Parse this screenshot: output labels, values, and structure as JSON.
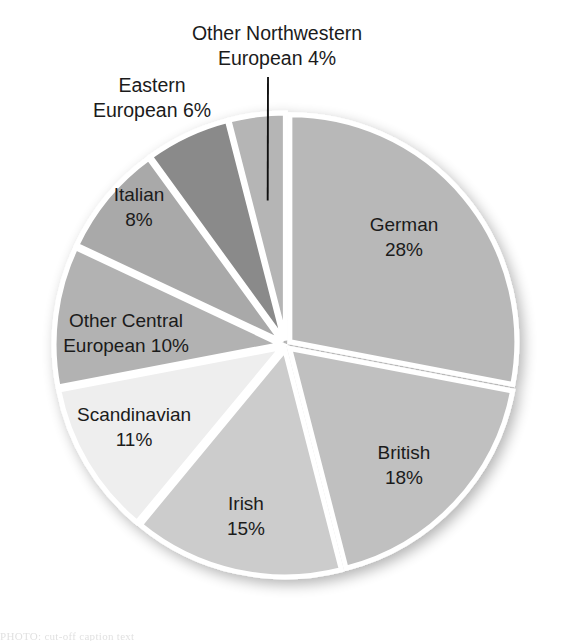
{
  "chart_data": {
    "type": "pie",
    "title": "",
    "subtitle": "",
    "xlabel": "",
    "ylabel": "",
    "legend_position": "none",
    "grid": false,
    "units": "percent",
    "start_angle_deg": 0,
    "direction": "clockwise",
    "categories": [
      "German",
      "British",
      "Irish",
      "Scandinavian",
      "Other Central European",
      "Italian",
      "Eastern European",
      "Other Northwestern European"
    ],
    "values": [
      28,
      18,
      15,
      11,
      10,
      8,
      6,
      4
    ],
    "slices": [
      {
        "name": "German",
        "value": 28,
        "label_line1": "German",
        "label_line2": "28%",
        "percent_text": "28%",
        "color": "#b8b8b8",
        "label_placement": "inside"
      },
      {
        "name": "British",
        "value": 18,
        "label_line1": "British",
        "label_line2": "18%",
        "percent_text": "18%",
        "color": "#c0c0c0",
        "label_placement": "inside"
      },
      {
        "name": "Irish",
        "value": 15,
        "label_line1": "Irish",
        "label_line2": "15%",
        "percent_text": "15%",
        "color": "#cccccc",
        "label_placement": "inside"
      },
      {
        "name": "Scandinavian",
        "value": 11,
        "label_line1": "Scandinavian",
        "label_line2": "11%",
        "percent_text": "11%",
        "color": "#eeeeee",
        "label_placement": "inside"
      },
      {
        "name": "Other Central European",
        "value": 10,
        "label_line1": "Other Central",
        "label_line2": "European 10%",
        "percent_text": "10%",
        "color": "#b2b2b2",
        "label_placement": "inside"
      },
      {
        "name": "Italian",
        "value": 8,
        "label_line1": "Italian",
        "label_line2": "8%",
        "percent_text": "8%",
        "color": "#a9a9a9",
        "label_placement": "inside"
      },
      {
        "name": "Eastern European",
        "value": 6,
        "label_line1": "Eastern",
        "label_line2": "European 6%",
        "percent_text": "6%",
        "color": "#8a8a8a",
        "label_placement": "outside"
      },
      {
        "name": "Other Northwestern European",
        "value": 4,
        "label_line1": "Other Northwestern",
        "label_line2": "European 4%",
        "percent_text": "4%",
        "color": "#b5b5b5",
        "label_placement": "outside-leader"
      }
    ],
    "colors": {
      "background": "#ffffff",
      "slice_border": "#ffffff",
      "label_text": "#1b1b1b",
      "leader_line": "#111111"
    }
  },
  "figure": {
    "bottom_caption_fragment": "PHOTO: cut-off caption text"
  }
}
